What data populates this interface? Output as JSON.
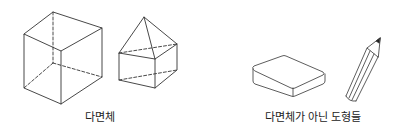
{
  "figures": {
    "polyhedra": {
      "label": "다면체",
      "items": [
        {
          "name": "cube",
          "kind": "hexahedron"
        },
        {
          "name": "pentahedron-house",
          "kind": "prism-with-pyramid-top"
        }
      ]
    },
    "non_polyhedra": {
      "label": "다면체가 아닌 도형들",
      "items": [
        {
          "name": "eraser",
          "kind": "rounded-box"
        },
        {
          "name": "pencil",
          "kind": "pencil"
        }
      ]
    }
  },
  "colors": {
    "stroke": "#333333",
    "text": "#222222"
  }
}
